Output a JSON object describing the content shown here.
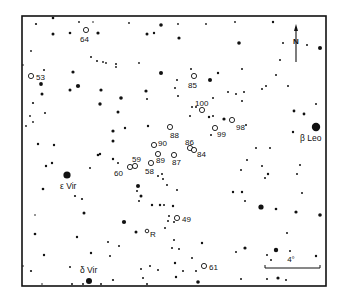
{
  "figure": {
    "type": "star-chart",
    "frame": {
      "x": 22,
      "y": 16,
      "width": 304,
      "height": 270
    },
    "ink_color": "#111111",
    "background": "#ffffff"
  },
  "compass": {
    "label": "N",
    "x": 296,
    "arrow_top": 24,
    "arrow_bottom": 62,
    "label_y": 44
  },
  "scale_bar": {
    "label": "4°",
    "x1": 265,
    "x2": 320,
    "y": 268,
    "label_x": 291,
    "label_y": 262
  },
  "named_stars": [
    {
      "label": "β Leo",
      "x": 316,
      "y": 127,
      "r": 4.2,
      "label_x": 300,
      "label_y": 141
    },
    {
      "label": "ε Vir",
      "x": 67,
      "y": 175,
      "r": 3.6,
      "label_x": 60,
      "label_y": 189
    },
    {
      "label": "δ Vir",
      "x": 89,
      "y": 281,
      "r": 3.0,
      "label_x": 80,
      "label_y": 273
    }
  ],
  "variable_stars": [
    {
      "label": "64",
      "x": 86,
      "y": 30,
      "label_x": 80,
      "label_y": 42
    },
    {
      "label": "53",
      "x": 31,
      "y": 76,
      "label_x": 36,
      "label_y": 80
    },
    {
      "label": "85",
      "x": 194,
      "y": 76,
      "label_x": 188,
      "label_y": 88
    },
    {
      "label": "100",
      "x": 202,
      "y": 110,
      "label_x": 195,
      "label_y": 106
    },
    {
      "label": "98",
      "x": 232,
      "y": 120,
      "label_x": 236,
      "label_y": 130
    },
    {
      "label": "99",
      "x": 215,
      "y": 128,
      "label_x": 217,
      "label_y": 137
    },
    {
      "label": "88",
      "x": 170,
      "y": 127,
      "label_x": 170,
      "label_y": 138
    },
    {
      "label": "86",
      "x": 190,
      "y": 148,
      "label_x": 185,
      "label_y": 145
    },
    {
      "label": "84",
      "x": 194,
      "y": 150,
      "label_x": 197,
      "label_y": 157
    },
    {
      "label": "90",
      "x": 154,
      "y": 145,
      "label_x": 158,
      "label_y": 146
    },
    {
      "label": "89",
      "x": 158,
      "y": 154,
      "label_x": 156,
      "label_y": 163
    },
    {
      "label": "87",
      "x": 174,
      "y": 155,
      "label_x": 172,
      "label_y": 165
    },
    {
      "label": "59",
      "x": 135,
      "y": 166,
      "label_x": 132,
      "label_y": 162
    },
    {
      "label": "60",
      "x": 130,
      "y": 167,
      "label_x": 114,
      "label_y": 176
    },
    {
      "label": "58",
      "x": 151,
      "y": 163,
      "label_x": 145,
      "label_y": 174
    },
    {
      "label": "R",
      "x": 147,
      "y": 231,
      "label_x": 150,
      "label_y": 237
    },
    {
      "label": "49",
      "x": 177,
      "y": 218,
      "label_x": 182,
      "label_y": 222
    },
    {
      "label": "61",
      "x": 204,
      "y": 266,
      "label_x": 209,
      "label_y": 270
    }
  ],
  "field_stars": [
    [
      36,
      24,
      1.1
    ],
    [
      53,
      18,
      1.3
    ],
    [
      79,
      22,
      0.9
    ],
    [
      70,
      33,
      1.3
    ],
    [
      53,
      34,
      1.5
    ],
    [
      98,
      33,
      1.6
    ],
    [
      93,
      22,
      0.8
    ],
    [
      129,
      23,
      0.9
    ],
    [
      147,
      34,
      1.5
    ],
    [
      154,
      33,
      1.2
    ],
    [
      161,
      25,
      1.8
    ],
    [
      31,
      51,
      0.9
    ],
    [
      23,
      65,
      0.8
    ],
    [
      44,
      70,
      1.0
    ],
    [
      73,
      72,
      1.6
    ],
    [
      41,
      84,
      1.9
    ],
    [
      78,
      86,
      2.1
    ],
    [
      42,
      94,
      1.5
    ],
    [
      70,
      90,
      1.5
    ],
    [
      101,
      90,
      1.6
    ],
    [
      91,
      57,
      1.0
    ],
    [
      97,
      61,
      1.0
    ],
    [
      103,
      62,
      0.9
    ],
    [
      106,
      63,
      0.9
    ],
    [
      116,
      64,
      1.0
    ],
    [
      116,
      67,
      0.9
    ],
    [
      139,
      63,
      0.9
    ],
    [
      161,
      73,
      2.0
    ],
    [
      121,
      98,
      1.8
    ],
    [
      100,
      104,
      1.7
    ],
    [
      146,
      91,
      1.6
    ],
    [
      147,
      99,
      1.0
    ],
    [
      118,
      112,
      1.5
    ],
    [
      33,
      103,
      1.1
    ],
    [
      45,
      113,
      1.0
    ],
    [
      30,
      116,
      0.9
    ],
    [
      26,
      126,
      0.9
    ],
    [
      33,
      122,
      0.9
    ],
    [
      113,
      131,
      1.6
    ],
    [
      125,
      128,
      1.2
    ],
    [
      148,
      126,
      1.2
    ],
    [
      38,
      144,
      1.2
    ],
    [
      54,
      145,
      1.2
    ],
    [
      113,
      141,
      1.5
    ],
    [
      178,
      24,
      0.9
    ],
    [
      206,
      24,
      0.9
    ],
    [
      235,
      22,
      0.9
    ],
    [
      273,
      22,
      1.2
    ],
    [
      179,
      38,
      1.6
    ],
    [
      239,
      43,
      1.8
    ],
    [
      283,
      43,
      1.0
    ],
    [
      307,
      45,
      1.0
    ],
    [
      320,
      48,
      2.0
    ],
    [
      280,
      60,
      1.0
    ],
    [
      276,
      75,
      1.0
    ],
    [
      266,
      86,
      1.0
    ],
    [
      242,
      69,
      1.0
    ],
    [
      218,
      73,
      1.2
    ],
    [
      210,
      80,
      2.0
    ],
    [
      191,
      69,
      1.0
    ],
    [
      177,
      80,
      1.0
    ],
    [
      175,
      88,
      1.0
    ],
    [
      178,
      96,
      1.0
    ],
    [
      213,
      98,
      1.0
    ],
    [
      228,
      92,
      1.0
    ],
    [
      236,
      94,
      1.0
    ],
    [
      244,
      92,
      1.0
    ],
    [
      242,
      101,
      1.0
    ],
    [
      262,
      89,
      1.0
    ],
    [
      288,
      86,
      1.0
    ],
    [
      316,
      104,
      1.0
    ],
    [
      294,
      111,
      1.4
    ],
    [
      304,
      114,
      1.4
    ],
    [
      192,
      107,
      1.0
    ],
    [
      190,
      116,
      1.0
    ],
    [
      209,
      117,
      1.2
    ],
    [
      224,
      119,
      1.6
    ],
    [
      213,
      116,
      1.0
    ],
    [
      196,
      107,
      1.0
    ],
    [
      211,
      135,
      1.0
    ],
    [
      246,
      125,
      1.0
    ],
    [
      256,
      148,
      1.0
    ],
    [
      270,
      148,
      1.0
    ],
    [
      293,
      132,
      1.2
    ],
    [
      46,
      166,
      1.2
    ],
    [
      52,
      163,
      1.2
    ],
    [
      98,
      155,
      1.3
    ],
    [
      100,
      154,
      1.2
    ],
    [
      113,
      159,
      1.2
    ],
    [
      118,
      163,
      1.0
    ],
    [
      90,
      168,
      1.0
    ],
    [
      162,
      174,
      1.0
    ],
    [
      158,
      176,
      1.0
    ],
    [
      163,
      179,
      1.0
    ],
    [
      167,
      185,
      1.0
    ],
    [
      138,
      186,
      2.0
    ],
    [
      137,
      191,
      1.0
    ],
    [
      43,
      189,
      1.3
    ],
    [
      75,
      196,
      1.1
    ],
    [
      82,
      199,
      1.1
    ],
    [
      141,
      196,
      1.5
    ],
    [
      139,
      201,
      1.0
    ],
    [
      160,
      205,
      1.2
    ],
    [
      152,
      205,
      1.2
    ],
    [
      84,
      213,
      1.5
    ],
    [
      35,
      215,
      0.8
    ],
    [
      124,
      222,
      2.1
    ],
    [
      169,
      216,
      1.0
    ],
    [
      168,
      221,
      1.0
    ],
    [
      174,
      222,
      1.0
    ],
    [
      164,
      205,
      1.0
    ],
    [
      177,
      190,
      1.0
    ],
    [
      173,
      206,
      1.2
    ],
    [
      165,
      228,
      1.0
    ],
    [
      136,
      232,
      1.5
    ],
    [
      174,
      240,
      1.0
    ],
    [
      172,
      248,
      1.0
    ],
    [
      179,
      249,
      1.0
    ],
    [
      35,
      234,
      1.3
    ],
    [
      77,
      237,
      1.2
    ],
    [
      108,
      242,
      1.0
    ],
    [
      119,
      246,
      1.0
    ],
    [
      44,
      255,
      1.2
    ],
    [
      91,
      253,
      1.2
    ],
    [
      110,
      256,
      1.0
    ],
    [
      70,
      267,
      1.0
    ],
    [
      31,
      271,
      1.1
    ],
    [
      23,
      266,
      0.8
    ],
    [
      150,
      266,
      1.0
    ],
    [
      175,
      263,
      1.2
    ],
    [
      192,
      258,
      1.0
    ],
    [
      202,
      243,
      1.2
    ],
    [
      176,
      277,
      1.2
    ],
    [
      196,
      271,
      1.0
    ],
    [
      183,
      271,
      1.0
    ],
    [
      141,
      269,
      1.0
    ],
    [
      143,
      278,
      1.0
    ],
    [
      158,
      270,
      1.0
    ],
    [
      198,
      282,
      1.8
    ],
    [
      147,
      284,
      1.0
    ],
    [
      83,
      284,
      1.0
    ],
    [
      101,
      284,
      1.0
    ],
    [
      113,
      280,
      1.1
    ],
    [
      42,
      284,
      0.8
    ],
    [
      72,
      284,
      1.0
    ],
    [
      233,
      192,
      1.2
    ],
    [
      242,
      192,
      1.2
    ],
    [
      245,
      201,
      1.0
    ],
    [
      241,
      170,
      1.0
    ],
    [
      247,
      160,
      1.0
    ],
    [
      262,
      166,
      1.0
    ],
    [
      268,
      174,
      1.2
    ],
    [
      265,
      178,
      1.0
    ],
    [
      276,
      209,
      1.3
    ],
    [
      302,
      193,
      1.0
    ],
    [
      297,
      174,
      1.0
    ],
    [
      300,
      165,
      1.0
    ],
    [
      261,
      207,
      2.6
    ],
    [
      296,
      212,
      1.6
    ],
    [
      320,
      215,
      1.8
    ],
    [
      287,
      233,
      1.0
    ],
    [
      276,
      250,
      2.2
    ],
    [
      245,
      248,
      1.6
    ],
    [
      236,
      252,
      1.0
    ],
    [
      267,
      255,
      1.0
    ],
    [
      267,
      279,
      1.0
    ],
    [
      278,
      278,
      1.6
    ],
    [
      286,
      280,
      1.0
    ],
    [
      316,
      256,
      1.2
    ],
    [
      290,
      251,
      1.0
    ],
    [
      271,
      260,
      1.0
    ],
    [
      241,
      279,
      1.0
    ]
  ]
}
